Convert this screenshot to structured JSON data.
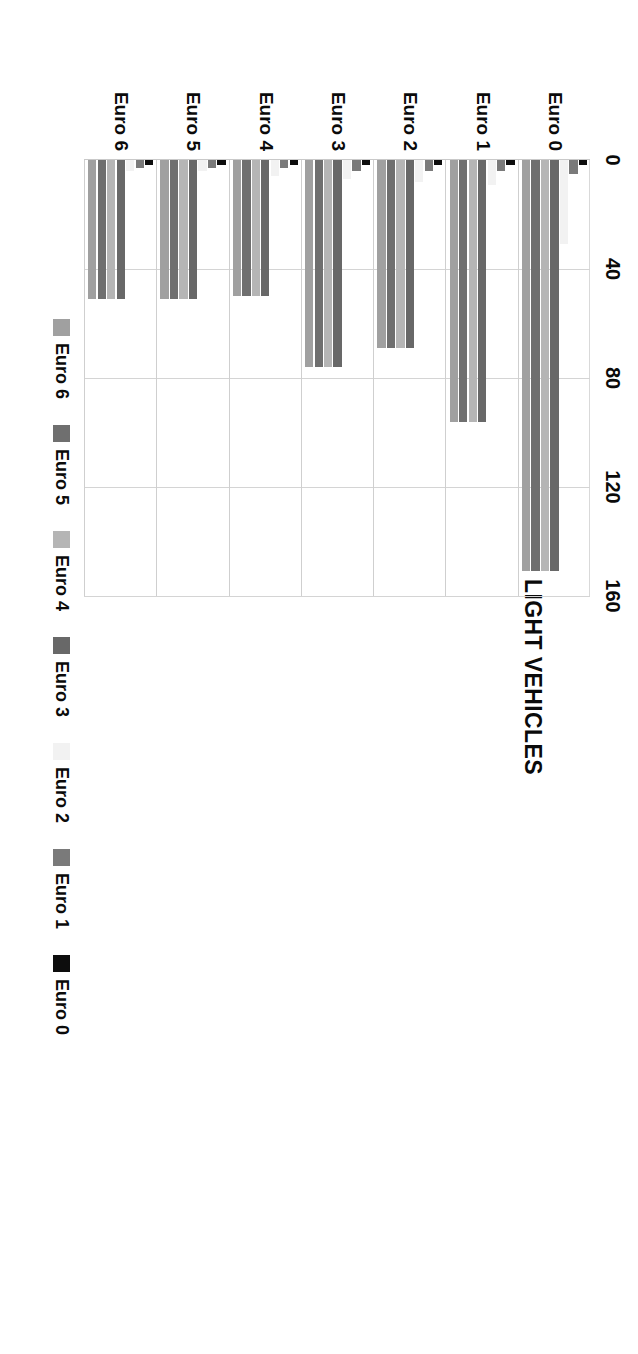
{
  "chart_data": {
    "type": "bar",
    "orientation": "horizontal",
    "title": "LIGHT VEHICLES",
    "xlabel": "LIGHT VEHICLES",
    "ylabel": "HEAVY VEHICLES",
    "xlim": [
      0,
      160
    ],
    "xticks": [
      0,
      40,
      80,
      120,
      160
    ],
    "tick_labels": [
      "0",
      "40",
      "80",
      "120",
      "160"
    ],
    "grid": true,
    "legend_position": "bottom",
    "categories": [
      "Euro 0",
      "Euro 1",
      "Euro 2",
      "Euro 3",
      "Euro 4",
      "Euro 5",
      "Euro 6"
    ],
    "series": [
      {
        "name": "Euro 0",
        "color": "#0d0d0d",
        "values": [
          2,
          2,
          2,
          2,
          2,
          2,
          2
        ]
      },
      {
        "name": "Euro 1",
        "color": "#7a7a7a",
        "values": [
          5,
          4,
          4,
          4,
          3,
          3,
          3
        ]
      },
      {
        "name": "Euro 2",
        "color": "#f2f2f2",
        "values": [
          31,
          9,
          8,
          7,
          6,
          4,
          4
        ]
      },
      {
        "name": "Euro 3",
        "color": "#686868",
        "values": [
          151,
          96,
          69,
          76,
          50,
          51,
          51
        ]
      },
      {
        "name": "Euro 4",
        "color": "#b5b5b5",
        "values": [
          151,
          96,
          69,
          76,
          50,
          51,
          51
        ]
      },
      {
        "name": "Euro 5",
        "color": "#6f6f6f",
        "values": [
          151,
          96,
          69,
          76,
          50,
          51,
          51
        ]
      },
      {
        "name": "Euro 6",
        "color": "#a0a0a0",
        "values": [
          151,
          96,
          69,
          76,
          50,
          51,
          51
        ]
      }
    ]
  },
  "axis": {
    "value_axis_title": "LIGHT VEHICLES",
    "category_axis_title": "HEAVY VEHICLES"
  },
  "legend": {
    "items": [
      {
        "label": "Euro 0",
        "color": "#0d0d0d"
      },
      {
        "label": "Euro 1",
        "color": "#7a7a7a"
      },
      {
        "label": "Euro 2",
        "color": "#f2f2f2"
      },
      {
        "label": "Euro 3",
        "color": "#686868"
      },
      {
        "label": "Euro 4",
        "color": "#b5b5b5"
      },
      {
        "label": "Euro 5",
        "color": "#6f6f6f"
      },
      {
        "label": "Euro 6",
        "color": "#a0a0a0"
      }
    ]
  }
}
